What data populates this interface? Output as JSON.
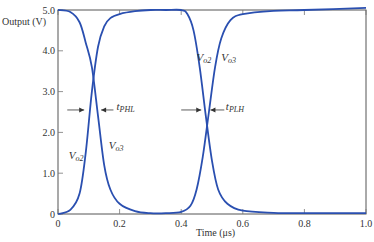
{
  "chart_data": {
    "type": "line",
    "title": "",
    "xlabel": "Time (μs)",
    "ylabel": "Output (V)",
    "xlim": [
      0,
      1.0
    ],
    "ylim": [
      0,
      5.0
    ],
    "grid": false,
    "x_ticks": [
      "0",
      "0.2",
      "0.4",
      "0.6",
      "0.8",
      "1.0"
    ],
    "y_ticks": [
      "0",
      "1.0",
      "2.0",
      "3.0",
      "4.0",
      "5.0"
    ],
    "line_color": "#2a4fb0",
    "series": [
      {
        "name": "Vo2",
        "x": [
          0,
          0.04,
          0.07,
          0.09,
          0.11,
          0.13,
          0.15,
          0.17,
          0.2,
          0.25,
          0.3,
          0.35,
          0.4,
          0.42,
          0.44,
          0.46,
          0.48,
          0.5,
          0.52,
          0.55,
          0.6,
          0.7,
          0.8,
          1.0
        ],
        "y": [
          0,
          0.1,
          0.5,
          1.5,
          3.0,
          4.1,
          4.6,
          4.8,
          4.9,
          4.97,
          5.0,
          5.0,
          5.0,
          4.9,
          4.5,
          3.6,
          2.4,
          1.3,
          0.6,
          0.25,
          0.08,
          0.03,
          0.02,
          0.02
        ]
      },
      {
        "name": "Vo3",
        "x": [
          0,
          0.04,
          0.07,
          0.09,
          0.11,
          0.13,
          0.15,
          0.17,
          0.2,
          0.25,
          0.3,
          0.35,
          0.4,
          0.43,
          0.45,
          0.47,
          0.49,
          0.51,
          0.53,
          0.56,
          0.6,
          0.7,
          0.8,
          1.0
        ],
        "y": [
          5.0,
          4.95,
          4.7,
          4.2,
          3.6,
          2.4,
          1.2,
          0.6,
          0.25,
          0.07,
          0.02,
          0.02,
          0.05,
          0.2,
          0.6,
          1.4,
          2.5,
          3.6,
          4.3,
          4.75,
          4.9,
          4.98,
          5.0,
          5.05
        ]
      }
    ],
    "annotations": [
      {
        "text": "tPHL",
        "main": "t",
        "sub": "PHL",
        "x": 0.19,
        "y": 2.55
      },
      {
        "text": "tPLH",
        "main": "t",
        "sub": "PLH",
        "x": 0.545,
        "y": 2.55
      },
      {
        "text": "Vo2",
        "main": "V",
        "sub": "o2",
        "x": 0.035,
        "y": 1.35
      },
      {
        "text": "Vo3",
        "main": "V",
        "sub": "o3",
        "x": 0.165,
        "y": 1.6
      },
      {
        "text": "Vo2",
        "main": "V",
        "sub": "o2",
        "x": 0.45,
        "y": 3.75
      },
      {
        "text": "Vo3",
        "main": "V",
        "sub": "o3",
        "x": 0.53,
        "y": 3.75
      }
    ]
  }
}
